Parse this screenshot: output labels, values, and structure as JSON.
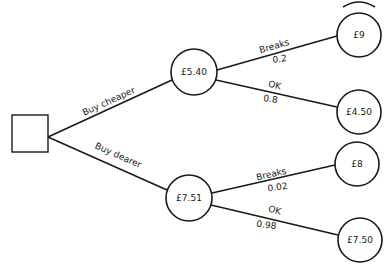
{
  "diagram": {
    "type": "decision-tree",
    "decision_node": {
      "label": ""
    },
    "options": [
      {
        "label": "Buy cheaper",
        "expected_value": "£5.40",
        "outcomes": [
          {
            "label": "Breaks",
            "probability": "0.2",
            "value": "£9"
          },
          {
            "label": "OK",
            "probability": "0.8",
            "value": "£4.50"
          }
        ]
      },
      {
        "label": "Buy dearer",
        "expected_value": "£7.51",
        "outcomes": [
          {
            "label": "Breaks",
            "probability": "0.02",
            "value": "£8"
          },
          {
            "label": "OK",
            "probability": "0.98",
            "value": "£7.50"
          }
        ]
      }
    ]
  },
  "colors": {
    "line": "#1a1a1a",
    "background": "#ffffff"
  }
}
